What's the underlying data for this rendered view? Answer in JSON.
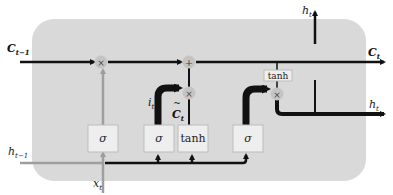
{
  "diagram": {
    "colors": {
      "cell_background": "#d9d9d9",
      "gate_box": "#eeeeee",
      "gate_border": "#bdbdbd",
      "line": "#111111",
      "input_line": "#9e9e9e",
      "operator_circle": "#c4c4c4"
    },
    "labels": {
      "c_prev": "C",
      "c_prev_sub": "t−1",
      "c_next": "C",
      "c_next_sub": "t",
      "h_prev": "h",
      "h_prev_sub": "t−1",
      "h_out_top": "h",
      "h_out_top_sub": "t",
      "h_out_right": "h",
      "h_out_right_sub": "t",
      "x_in": "x",
      "x_in_sub": "t",
      "i_gate": "i",
      "i_gate_sub": "t",
      "c_tilde": "C",
      "c_tilde_sub": "t",
      "c_tilde_mark": "~"
    },
    "gates": {
      "forget": "σ",
      "input": "σ",
      "candidate": "tanh",
      "output": "σ",
      "output_tanh": "tanh"
    },
    "operators": {
      "forget_mul": "×",
      "add": "+",
      "input_mul": "×",
      "output_mul": "×"
    }
  }
}
